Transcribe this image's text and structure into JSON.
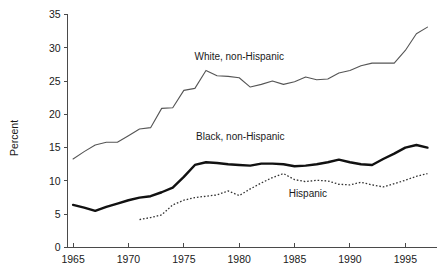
{
  "chart_data": {
    "type": "line",
    "title": "",
    "xlabel": "",
    "ylabel": "Percent",
    "xlim": [
      1964,
      1997.5
    ],
    "ylim": [
      0,
      35
    ],
    "grid": false,
    "legend": "inline-annotations",
    "x_ticks": [
      "1965",
      "1970",
      "1975",
      "1980",
      "1985",
      "1990",
      "1995"
    ],
    "x_tick_values": [
      1965,
      1970,
      1975,
      1980,
      1985,
      1990,
      1995
    ],
    "y_ticks": [
      "0",
      "5",
      "10",
      "15",
      "20",
      "25",
      "30",
      "35"
    ],
    "y_tick_values": [
      0,
      5,
      10,
      15,
      20,
      25,
      30,
      35
    ],
    "series": [
      {
        "name": "White, non-Hispanic",
        "style": "thin-solid",
        "color": "#555555",
        "label_text": "White, non-Hispanic",
        "x": [
          1965,
          1966,
          1967,
          1968,
          1969,
          1970,
          1971,
          1972,
          1973,
          1974,
          1975,
          1976,
          1977,
          1978,
          1979,
          1980,
          1981,
          1982,
          1983,
          1984,
          1985,
          1986,
          1987,
          1988,
          1989,
          1990,
          1991,
          1992,
          1993,
          1994,
          1995,
          1996,
          1997
        ],
        "values": [
          13.3,
          14.4,
          15.4,
          15.8,
          15.8,
          16.8,
          17.8,
          18.0,
          20.9,
          21.0,
          23.6,
          23.9,
          26.6,
          25.8,
          25.7,
          25.5,
          24.1,
          24.5,
          25.0,
          24.5,
          24.9,
          25.6,
          25.2,
          25.3,
          26.2,
          26.6,
          27.3,
          27.7,
          27.7,
          27.7,
          29.6,
          32.1,
          33.1
        ]
      },
      {
        "name": "Black, non-Hispanic",
        "style": "thick-solid",
        "color": "#111111",
        "label_text": "Black, non-Hispanic",
        "x": [
          1965,
          1966,
          1967,
          1968,
          1969,
          1970,
          1971,
          1972,
          1973,
          1974,
          1975,
          1976,
          1977,
          1978,
          1979,
          1980,
          1981,
          1982,
          1983,
          1984,
          1985,
          1986,
          1987,
          1988,
          1989,
          1990,
          1991,
          1992,
          1993,
          1994,
          1995,
          1996,
          1997
        ],
        "values": [
          6.4,
          6.0,
          5.5,
          6.1,
          6.6,
          7.1,
          7.5,
          7.7,
          8.3,
          9.0,
          10.6,
          12.4,
          12.8,
          12.7,
          12.5,
          12.4,
          12.3,
          12.6,
          12.6,
          12.5,
          12.2,
          12.3,
          12.5,
          12.8,
          13.2,
          12.8,
          12.5,
          12.4,
          13.3,
          14.1,
          15.0,
          15.4,
          15.0
        ]
      },
      {
        "name": "Hispanic",
        "style": "dotted",
        "color": "#333333",
        "label_text": "Hispanic",
        "x": [
          1971,
          1972,
          1973,
          1974,
          1975,
          1976,
          1977,
          1978,
          1979,
          1980,
          1981,
          1982,
          1983,
          1984,
          1985,
          1986,
          1987,
          1988,
          1989,
          1990,
          1991,
          1992,
          1993,
          1994,
          1995,
          1996,
          1997
        ],
        "values": [
          4.2,
          4.5,
          4.9,
          6.4,
          7.1,
          7.5,
          7.7,
          7.9,
          8.5,
          7.8,
          8.8,
          9.7,
          10.5,
          11.1,
          10.2,
          9.9,
          10.1,
          10.0,
          9.5,
          9.4,
          9.8,
          9.4,
          9.1,
          9.6,
          10.1,
          10.7,
          11.1
        ]
      }
    ],
    "annotations": [
      {
        "text": "White, non-Hispanic",
        "x": 1980.0,
        "y": 28.2
      },
      {
        "text": "Black, non-Hispanic",
        "x": 1980.1,
        "y": 16.1
      },
      {
        "text": "Hispanic",
        "x": 1986.2,
        "y": 7.6
      }
    ]
  }
}
